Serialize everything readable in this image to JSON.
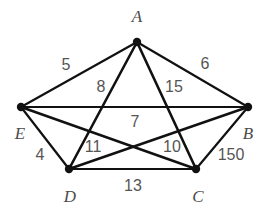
{
  "figure": {
    "kind": "weighted-graph-diagram",
    "background_color": "#ffffff",
    "edge_color": "#111111",
    "vertex_color": "#111111",
    "vertex_label_color": "#4b4b4b",
    "edge_label_color": "#555555"
  },
  "chart_data": {
    "type": "diagram",
    "title": "",
    "graph_type": "complete-weighted-graph",
    "vertices": [
      {
        "id": "A",
        "label": "A",
        "x": 137,
        "y": 42,
        "label_x": 137,
        "label_y": 16
      },
      {
        "id": "B",
        "label": "B",
        "x": 248,
        "y": 107,
        "label_x": 248,
        "label_y": 133
      },
      {
        "id": "C",
        "label": "C",
        "x": 196,
        "y": 169,
        "label_x": 198,
        "label_y": 196
      },
      {
        "id": "D",
        "label": "D",
        "x": 69,
        "y": 169,
        "label_x": 70,
        "label_y": 196
      },
      {
        "id": "E",
        "label": "E",
        "x": 21,
        "y": 107,
        "label_x": 20,
        "label_y": 133
      }
    ],
    "edges": [
      {
        "from": "E",
        "to": "A",
        "weight": "5",
        "label_x": 66,
        "label_y": 65,
        "width": 2.2
      },
      {
        "from": "A",
        "to": "B",
        "weight": "6",
        "label_x": 205,
        "label_y": 64,
        "width": 2.2
      },
      {
        "from": "A",
        "to": "D",
        "weight": "8",
        "label_x": 101,
        "label_y": 87,
        "width": 2.6
      },
      {
        "from": "A",
        "to": "C",
        "weight": "15",
        "label_x": 174,
        "label_y": 87,
        "width": 2.6
      },
      {
        "from": "E",
        "to": "B",
        "weight": "7",
        "label_x": 135,
        "label_y": 122,
        "width": 2.2
      },
      {
        "from": "E",
        "to": "D",
        "weight": "4",
        "label_x": 40,
        "label_y": 155,
        "width": 2.2
      },
      {
        "from": "E",
        "to": "C",
        "weight": "11",
        "label_x": 93,
        "label_y": 147,
        "width": 2.4
      },
      {
        "from": "D",
        "to": "B",
        "weight": "10",
        "label_x": 172,
        "label_y": 147,
        "width": 2.4
      },
      {
        "from": "B",
        "to": "C",
        "weight": "150",
        "label_x": 231,
        "label_y": 155,
        "width": 2.2
      },
      {
        "from": "D",
        "to": "C",
        "weight": "13",
        "label_x": 133,
        "label_y": 186,
        "width": 2.2
      }
    ],
    "vertex_radius": 4.2
  }
}
